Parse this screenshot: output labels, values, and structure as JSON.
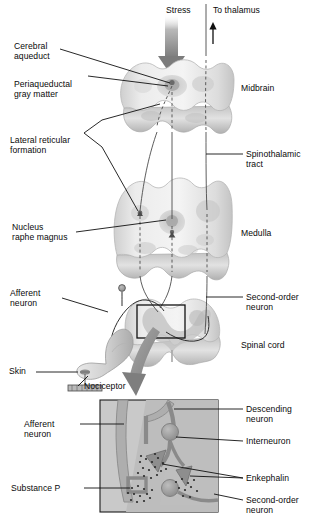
{
  "figure": {
    "palette": {
      "ink": "#0a0a0a",
      "tissue_light": "#efefef",
      "tissue_mid": "#d8d8d8",
      "tissue_shade": "#bdbdbd",
      "tissue_dark": "#9e9e9e",
      "arrow_gray": "#8c8c8c",
      "arrow_dark": "#6e6e6e",
      "inset_bg": "#c9c9c9",
      "inset_neuron": "#a9a9a9",
      "inset_outline": "#8a8a8a",
      "soma": "#9a9a9a",
      "white": "#ffffff"
    }
  },
  "labels": {
    "stress": "Stress",
    "to_thalamus": "To thalamus",
    "cerebral_aqueduct": "Cerebral\naqueduct",
    "periaqueductal_gray": "Periaqueductal\ngray matter",
    "lateral_reticular_formation": "Lateral reticular\nformation",
    "nucleus_raphe_magnus": "Nucleus\nraphe magnus",
    "afferent_neuron_upper": "Afferent\nneuron",
    "skin": "Skin",
    "nociceptor": "Nociceptor",
    "midbrain": "Midbrain",
    "spinothalamic_tract": "Spinothalamic\ntract",
    "medulla": "Medulla",
    "second_order_neuron_upper": "Second-order\nneuron",
    "spinal_cord": "Spinal cord",
    "descending_neuron": "Descending\nneuron",
    "interneuron": "Interneuron",
    "enkephalin": "Enkephalin",
    "second_order_neuron_inset": "Second-order\nneuron",
    "afferent_neuron_inset": "Afferent\nneuron",
    "substance_p": "Substance P"
  },
  "structures": {
    "midbrain": "midbrain-cross-section",
    "medulla": "medulla-cross-section",
    "spinal_cord": "spinal-cord-cross-section",
    "skin_limb": "skin-limb-shape",
    "inset": "spinal-dorsal-horn-detail"
  },
  "icons": {
    "stress_arrow": "down-arrow-icon",
    "thalamus_arrow": "up-arrow-icon",
    "magnify_arrow": "curved-zoom-arrow-icon",
    "callout_box": "inset-reference-box-icon",
    "ganglion": "dorsal-root-ganglion-icon",
    "nociceptor_marker": "nociceptor-ending-icon"
  }
}
